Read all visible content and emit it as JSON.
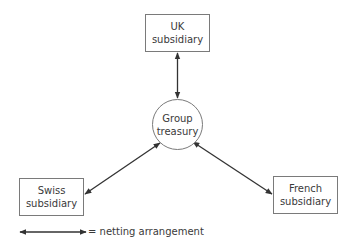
{
  "diagram": {
    "nodes": {
      "uk": {
        "line1": "UK",
        "line2": "subsidiary"
      },
      "treasury": {
        "line1": "Group",
        "line2": "treasury"
      },
      "swiss": {
        "line1": "Swiss",
        "line2": "subsidiary"
      },
      "french": {
        "line1": "French",
        "line2": "subsidiary"
      }
    },
    "edges": [
      {
        "from": "UK subsidiary",
        "to": "Group treasury",
        "type": "bidirectional"
      },
      {
        "from": "Swiss subsidiary",
        "to": "Group treasury",
        "type": "bidirectional"
      },
      {
        "from": "French subsidiary",
        "to": "Group treasury",
        "type": "bidirectional"
      }
    ],
    "legend": {
      "symbol": "double-headed-arrow",
      "label": "= netting arrangement"
    },
    "colors": {
      "line": "#333333",
      "border": "#7a7a7a",
      "text": "#3a3a3a",
      "background": "#ffffff"
    }
  }
}
